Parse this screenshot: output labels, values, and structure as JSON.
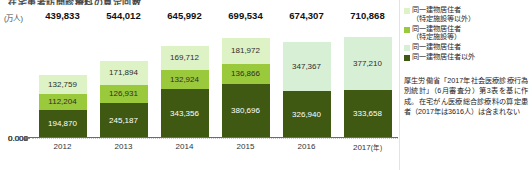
{
  "header": {
    "title": "在宅患者訪問診療料の算定回数"
  },
  "axis": {
    "unit_label": "(万人)",
    "y_ticks": [
      "80",
      "60",
      "40",
      "20",
      "0"
    ],
    "x_year_suffix": "(年)"
  },
  "legend": {
    "items": [
      {
        "name": "legend-same-building-other",
        "color": "#ddf2c5",
        "line1": "同一建物居住者",
        "line2": "（特定施設等以外）"
      },
      {
        "name": "legend-same-building-facility",
        "color": "#9ac93c",
        "line1": "同一建物居住者",
        "line2": "（特定施設等）"
      },
      {
        "name": "legend-same-building",
        "color": "#d7efd4",
        "line1": "同一建物居住者",
        "line2": ""
      },
      {
        "name": "legend-not-same-building",
        "color": "#3f5913",
        "line1": "同一建物居住者以外",
        "line2": ""
      }
    ]
  },
  "note": {
    "text": "厚生労働省「2017年社会医療診療行為別統計」（6月審査分）第3表を基に作成。在宅がん医療総合診療料の算定患者（2017年は3616人）は含まれない"
  },
  "chart_data": {
    "type": "bar",
    "title": "在宅患者訪問診療料の算定回数",
    "xlabel": "(年)",
    "ylabel": "(万人)",
    "ylim": [
      0,
      80
    ],
    "yticks": [
      0,
      20,
      40,
      60,
      80
    ],
    "grid": true,
    "legend_position": "right",
    "stacked": true,
    "categories": [
      "2012",
      "2013",
      "2014",
      "2015",
      "2016",
      "2017"
    ],
    "series": [
      {
        "name": "同一建物居住者以外",
        "color": "#3f5913",
        "values": [
          194870,
          245187,
          343356,
          380696,
          326940,
          333658
        ],
        "labels": [
          "194,870",
          "245,187",
          "343,356",
          "380,696",
          "326,940",
          "333,658"
        ]
      },
      {
        "name": "同一建物居住者（特定施設等）",
        "color": "#9ac93c",
        "values": [
          112204,
          126931,
          132924,
          136866,
          null,
          null
        ],
        "labels": [
          "112,204",
          "126,931",
          "132,924",
          "136,866",
          "",
          ""
        ]
      },
      {
        "name": "同一建物居住者（特定施設等以外）",
        "color": "#ddf2c5",
        "values": [
          132759,
          171894,
          169712,
          181972,
          null,
          null
        ],
        "labels": [
          "132,759",
          "171,894",
          "169,712",
          "181,972",
          "",
          ""
        ]
      },
      {
        "name": "同一建物居住者",
        "color": "#d7efd4",
        "values": [
          null,
          null,
          null,
          null,
          347367,
          377210
        ],
        "labels": [
          "",
          "",
          "",
          "",
          "347,367",
          "377,210"
        ]
      }
    ],
    "totals": [
      439833,
      544012,
      645992,
      699534,
      674307,
      710868
    ],
    "total_labels": [
      "439,833",
      "544,012",
      "645,992",
      "699,534",
      "674,307",
      "710,868"
    ]
  },
  "bars": [
    {
      "year": "2012",
      "total": "439,833",
      "segments": [
        {
          "cls": "pale",
          "value": "132,759",
          "num": 132759
        },
        {
          "cls": "mid",
          "value": "112,204",
          "num": 112204
        },
        {
          "cls": "dark",
          "value": "194,870",
          "num": 194870
        }
      ]
    },
    {
      "year": "2013",
      "total": "544,012",
      "segments": [
        {
          "cls": "pale",
          "value": "171,894",
          "num": 171894
        },
        {
          "cls": "mid",
          "value": "126,931",
          "num": 126931
        },
        {
          "cls": "dark",
          "value": "245,187",
          "num": 245187
        }
      ]
    },
    {
      "year": "2014",
      "total": "645,992",
      "segments": [
        {
          "cls": "pale",
          "value": "169,712",
          "num": 169712
        },
        {
          "cls": "mid",
          "value": "132,924",
          "num": 132924
        },
        {
          "cls": "dark",
          "value": "343,356",
          "num": 343356
        }
      ]
    },
    {
      "year": "2015",
      "total": "699,534",
      "segments": [
        {
          "cls": "pale",
          "value": "181,972",
          "num": 181972
        },
        {
          "cls": "mid",
          "value": "136,866",
          "num": 136866
        },
        {
          "cls": "dark",
          "value": "380,696",
          "num": 380696
        }
      ]
    },
    {
      "year": "2016",
      "total": "674,307",
      "segments": [
        {
          "cls": "mint",
          "value": "347,367",
          "num": 347367
        },
        {
          "cls": "dark",
          "value": "326,940",
          "num": 326940
        }
      ]
    },
    {
      "year": "2017",
      "total": "710,868",
      "suffix": "(年)",
      "segments": [
        {
          "cls": "mint",
          "value": "377,210",
          "num": 377210
        },
        {
          "cls": "dark",
          "value": "333,658",
          "num": 333658
        }
      ]
    }
  ]
}
